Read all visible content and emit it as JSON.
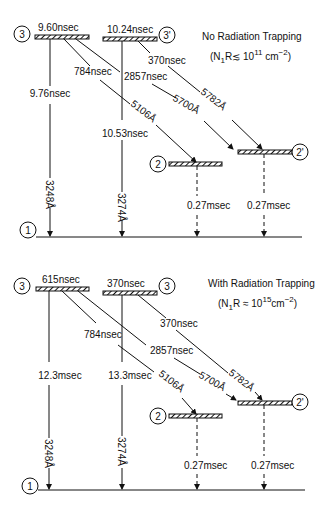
{
  "panels": [
    {
      "id": "no-trapping",
      "title": "No Radiation Trapping",
      "condition": "(N₁R ≲ 10¹¹ cm⁻²)",
      "condition_parts": {
        "pre": "(N",
        "sub": "1",
        "mid": "R",
        "rel": "≲",
        "base": " 10",
        "exp": "11",
        "unit": " cm",
        "unitexp": "−2",
        "post": ")"
      },
      "levels": {
        "level3": {
          "label": "3",
          "lifetime": "9.60nsec"
        },
        "level3p": {
          "label": "3'",
          "lifetime": "10.24nsec"
        },
        "level2": {
          "label": "2"
        },
        "level2p": {
          "label": "2'"
        },
        "level1": {
          "label": "1"
        }
      },
      "transitions": {
        "t3_1": {
          "lifetime": "9.76nsec",
          "wavelength": "3248Å"
        },
        "t3p_1": {
          "lifetime": "10.53nsec",
          "wavelength": "3274Å"
        },
        "t3_2": {
          "lifetime": "784nsec",
          "wavelength": "5106Å"
        },
        "t3_2p": {
          "lifetime": "2857nsec",
          "wavelength": "5700Å"
        },
        "t3p_2p": {
          "lifetime": "370nsec",
          "wavelength": "5782Å"
        },
        "t2_1": {
          "lifetime": "0.27msec"
        },
        "t2p_1": {
          "lifetime": "0.27msec"
        }
      }
    },
    {
      "id": "with-trapping",
      "title": "With Radiation Trapping",
      "condition": "(N₁R ≈ 10¹⁵cm⁻²)",
      "condition_parts": {
        "pre": "(N",
        "sub": "1",
        "mid": "R",
        "rel": " ≈",
        "base": " 10",
        "exp": "15",
        "unit": "cm",
        "unitexp": "−2",
        "post": ")"
      },
      "levels": {
        "level3": {
          "label": "3",
          "lifetime": "615nsec"
        },
        "level3p": {
          "label": "3",
          "lifetime": "370nsec"
        },
        "level2": {
          "label": "2"
        },
        "level2p": {
          "label": "2'"
        },
        "level1": {
          "label": "1"
        }
      },
      "transitions": {
        "t3_1": {
          "lifetime": "12.3msec",
          "wavelength": "3248Å"
        },
        "t3p_1": {
          "lifetime": "13.3msec",
          "wavelength": "3274Å"
        },
        "t3_2": {
          "lifetime": "784nsec",
          "wavelength": "5106Å"
        },
        "t3_2p": {
          "lifetime": "2857nsec",
          "wavelength": "5700Å"
        },
        "t3p_2p": {
          "lifetime": "370nsec",
          "wavelength": "5782Å"
        },
        "t2_1": {
          "lifetime": "0.27msec"
        },
        "t2p_1": {
          "lifetime": "0.27msec"
        }
      }
    }
  ]
}
